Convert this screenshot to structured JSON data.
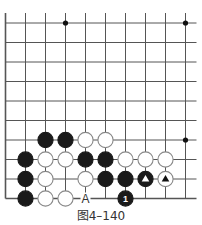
{
  "diagram": {
    "caption": "图4–140",
    "grid": {
      "cols": 10,
      "rows": 10,
      "origin_x": 5.5,
      "origin_y": 23,
      "spacing_x": 20,
      "spacing_y": 19.5,
      "line_color": "#555555",
      "open_top": true,
      "open_right": true
    },
    "hoshi": [
      {
        "col": 3,
        "row": 0
      },
      {
        "col": 9,
        "row": 0
      },
      {
        "col": 9,
        "row": 6
      }
    ],
    "stones": [
      {
        "color": "black",
        "col": 2,
        "row": 6
      },
      {
        "color": "black",
        "col": 3,
        "row": 6
      },
      {
        "color": "white",
        "col": 4,
        "row": 6
      },
      {
        "color": "white",
        "col": 5,
        "row": 6
      },
      {
        "color": "black",
        "col": 1,
        "row": 7
      },
      {
        "color": "white",
        "col": 2,
        "row": 7
      },
      {
        "color": "white",
        "col": 3,
        "row": 7
      },
      {
        "color": "black",
        "col": 4,
        "row": 7
      },
      {
        "color": "black",
        "col": 5,
        "row": 7
      },
      {
        "color": "white",
        "col": 6,
        "row": 7
      },
      {
        "color": "white",
        "col": 7,
        "row": 7
      },
      {
        "color": "white",
        "col": 8,
        "row": 7
      },
      {
        "color": "black",
        "col": 1,
        "row": 8
      },
      {
        "color": "white",
        "col": 2,
        "row": 8
      },
      {
        "color": "white",
        "col": 4,
        "row": 8
      },
      {
        "color": "black",
        "col": 5,
        "row": 8
      },
      {
        "color": "black",
        "col": 6,
        "row": 8
      },
      {
        "color": "black",
        "col": 7,
        "row": 8,
        "mark": "triangle"
      },
      {
        "color": "white",
        "col": 8,
        "row": 8,
        "mark": "triangle"
      },
      {
        "color": "black",
        "col": 1,
        "row": 9
      },
      {
        "color": "white",
        "col": 2,
        "row": 9
      },
      {
        "color": "white",
        "col": 3,
        "row": 9
      },
      {
        "color": "black",
        "col": 6,
        "row": 9,
        "number": "1"
      }
    ],
    "labels": [
      {
        "text": "A",
        "col": 4,
        "row": 9
      }
    ]
  }
}
